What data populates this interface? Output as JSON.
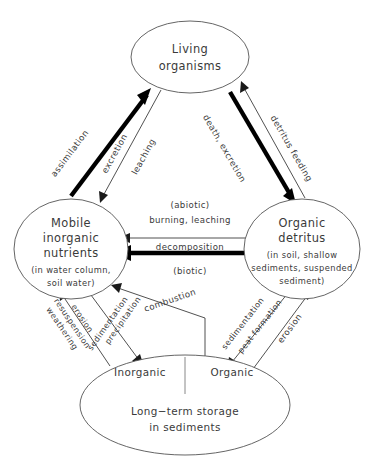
{
  "diagram": {
    "background_color": "#ffffff",
    "line_color": "#3d3d3d",
    "text_color": "#3a3a3a",
    "nodes": {
      "living": {
        "title_line1": "Living",
        "title_line2": "organisms"
      },
      "mobile": {
        "title_line1": "Mobile",
        "title_line2": "inorganic",
        "title_line3": "nutrients",
        "sub_line1": "(in water column,",
        "sub_line2": "soil  water)"
      },
      "detritus": {
        "title_line1": "Organic",
        "title_line2": "detritus",
        "sub_line1": "(in soil, shallow",
        "sub_line2": "sediments, suspended",
        "sub_line3": "sediment)"
      },
      "storage": {
        "compartment_left": "Inorganic",
        "compartment_right": "Organic",
        "title_line1": "Long−term  storage",
        "title_line2": "in  sediments"
      }
    },
    "edges": {
      "assimilation": {
        "label": "assimilation",
        "from": "mobile",
        "to": "living",
        "weight": "thick"
      },
      "excretion": {
        "label": "excretion",
        "from": "living",
        "to": "mobile",
        "weight": "thin"
      },
      "leaching_upper": {
        "label": "leaching",
        "from": "living",
        "to": "mobile",
        "weight": "thin"
      },
      "death_excretion": {
        "label": "death, excretion",
        "from": "living",
        "to": "detritus",
        "weight": "thick"
      },
      "detritus_feeding": {
        "label": "detritus feeding",
        "from": "detritus",
        "to": "living",
        "weight": "thin"
      },
      "abiotic": {
        "label_top": "(abiotic)",
        "label_main": "burning,  leaching",
        "from": "detritus",
        "to": "mobile",
        "weight": "thin"
      },
      "decomposition": {
        "label_main": "decomposition",
        "label_bottom": "(biotic)",
        "from": "detritus",
        "to": "mobile",
        "weight": "thick"
      },
      "erosion_resuspension_weathering": {
        "label_line1": "erosion",
        "label_line2": "resuspension",
        "label_line3": "weathering",
        "from": "storage",
        "to": "mobile",
        "weight": "thin"
      },
      "precipitation_sedimentation": {
        "label_line1": "precipitation",
        "label_line2": "sedimentation",
        "from": "mobile",
        "to": "storage",
        "weight": "thin"
      },
      "combustion": {
        "label": "combustion",
        "from": "storage",
        "to": "mobile",
        "weight": "thin"
      },
      "sedimentation_peat": {
        "label_line1": "sedimentation",
        "label_line2": "peat  formation",
        "from": "detritus",
        "to": "storage",
        "weight": "thin"
      },
      "erosion_right": {
        "label": "erosion",
        "from": "storage",
        "to": "detritus",
        "weight": "thin"
      }
    }
  }
}
